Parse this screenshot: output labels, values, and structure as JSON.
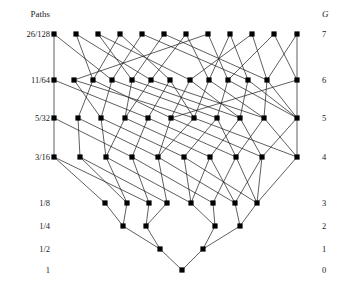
{
  "figure": {
    "header_left": "Paths",
    "header_right": "G",
    "node_color": "#000000",
    "edge_color": "#1a1a1a",
    "background": "#ffffff"
  },
  "chart_data": {
    "type": "diagram",
    "title": "",
    "xlabel": "",
    "ylabel": "",
    "header_left": "Paths",
    "header_right": "G",
    "row_labels_left": [
      "26/128",
      "11/64",
      "5/32",
      "3/16",
      "1/8",
      "1/4",
      "1/2",
      "1"
    ],
    "row_labels_right": [
      "7",
      "6",
      "5",
      "4",
      "3",
      "2",
      "1",
      "0"
    ],
    "row_y": [
      34,
      80,
      118,
      157,
      203,
      226,
      249,
      270
    ],
    "row_counts": [
      12,
      13,
      11,
      10,
      8,
      4,
      2,
      1
    ],
    "nodes": {
      "g7": [
        54,
        76,
        98,
        120,
        142,
        164,
        186,
        208,
        230,
        252,
        274,
        297
      ],
      "g6": [
        54,
        74,
        93,
        112,
        132,
        151,
        170,
        190,
        209,
        228,
        248,
        267,
        297
      ],
      "g5": [
        54,
        78,
        101,
        125,
        148,
        171,
        194,
        217,
        240,
        264,
        297
      ],
      "g4": [
        54,
        80,
        106,
        132,
        158,
        184,
        210,
        236,
        262,
        297
      ],
      "g3": [
        105,
        127,
        149,
        167,
        191,
        213,
        235,
        257
      ],
      "g2": [
        123,
        146,
        215,
        240
      ],
      "g1": [
        160,
        203
      ],
      "g0": [
        182
      ]
    },
    "edges": [
      [
        7,
        0,
        6,
        0
      ],
      [
        7,
        0,
        6,
        3
      ],
      [
        7,
        1,
        6,
        2
      ],
      [
        7,
        1,
        6,
        5
      ],
      [
        7,
        2,
        6,
        4
      ],
      [
        7,
        2,
        6,
        7
      ],
      [
        7,
        3,
        6,
        2
      ],
      [
        7,
        3,
        6,
        6
      ],
      [
        7,
        4,
        6,
        3
      ],
      [
        7,
        4,
        6,
        10
      ],
      [
        7,
        5,
        6,
        4
      ],
      [
        7,
        5,
        6,
        11
      ],
      [
        7,
        6,
        6,
        5
      ],
      [
        7,
        6,
        6,
        8
      ],
      [
        7,
        7,
        6,
        1
      ],
      [
        7,
        7,
        6,
        9
      ],
      [
        7,
        8,
        6,
        8
      ],
      [
        7,
        8,
        6,
        10
      ],
      [
        7,
        9,
        6,
        7
      ],
      [
        7,
        9,
        6,
        11
      ],
      [
        7,
        10,
        6,
        9
      ],
      [
        7,
        10,
        6,
        12
      ],
      [
        7,
        11,
        6,
        11
      ],
      [
        7,
        11,
        6,
        12
      ],
      [
        6,
        0,
        5,
        0
      ],
      [
        6,
        0,
        5,
        4
      ],
      [
        6,
        1,
        5,
        2
      ],
      [
        6,
        1,
        5,
        6
      ],
      [
        6,
        2,
        5,
        1
      ],
      [
        6,
        2,
        5,
        5
      ],
      [
        6,
        3,
        5,
        2
      ],
      [
        6,
        3,
        5,
        7
      ],
      [
        6,
        4,
        5,
        3
      ],
      [
        6,
        4,
        5,
        8
      ],
      [
        6,
        5,
        5,
        3
      ],
      [
        6,
        5,
        5,
        9
      ],
      [
        6,
        6,
        5,
        4
      ],
      [
        6,
        6,
        5,
        6
      ],
      [
        6,
        7,
        5,
        5
      ],
      [
        6,
        7,
        5,
        8
      ],
      [
        6,
        8,
        5,
        6
      ],
      [
        6,
        8,
        5,
        9
      ],
      [
        6,
        9,
        5,
        7
      ],
      [
        6,
        9,
        5,
        10
      ],
      [
        6,
        10,
        5,
        8
      ],
      [
        6,
        10,
        5,
        10
      ],
      [
        6,
        11,
        5,
        9
      ],
      [
        6,
        11,
        5,
        10
      ],
      [
        6,
        12,
        5,
        10
      ],
      [
        6,
        12,
        5,
        5
      ],
      [
        5,
        0,
        4,
        0
      ],
      [
        5,
        0,
        4,
        3
      ],
      [
        5,
        1,
        4,
        1
      ],
      [
        5,
        1,
        4,
        4
      ],
      [
        5,
        2,
        4,
        2
      ],
      [
        5,
        2,
        4,
        5
      ],
      [
        5,
        3,
        4,
        2
      ],
      [
        5,
        3,
        4,
        6
      ],
      [
        5,
        4,
        4,
        3
      ],
      [
        5,
        4,
        4,
        7
      ],
      [
        5,
        5,
        4,
        4
      ],
      [
        5,
        5,
        4,
        8
      ],
      [
        5,
        6,
        4,
        4
      ],
      [
        5,
        6,
        4,
        9
      ],
      [
        5,
        7,
        4,
        5
      ],
      [
        5,
        7,
        4,
        7
      ],
      [
        5,
        8,
        4,
        6
      ],
      [
        5,
        8,
        4,
        8
      ],
      [
        5,
        9,
        4,
        7
      ],
      [
        5,
        9,
        4,
        9
      ],
      [
        5,
        10,
        4,
        9
      ],
      [
        5,
        10,
        4,
        8
      ],
      [
        4,
        0,
        3,
        0
      ],
      [
        4,
        0,
        3,
        2
      ],
      [
        4,
        1,
        3,
        1
      ],
      [
        4,
        1,
        3,
        3
      ],
      [
        4,
        2,
        3,
        1
      ],
      [
        4,
        2,
        3,
        4
      ],
      [
        4,
        3,
        3,
        2
      ],
      [
        4,
        3,
        3,
        5
      ],
      [
        4,
        4,
        3,
        3
      ],
      [
        4,
        4,
        3,
        6
      ],
      [
        4,
        5,
        3,
        4
      ],
      [
        4,
        5,
        3,
        7
      ],
      [
        4,
        6,
        3,
        4
      ],
      [
        4,
        6,
        3,
        6
      ],
      [
        4,
        7,
        3,
        5
      ],
      [
        4,
        7,
        3,
        7
      ],
      [
        4,
        8,
        3,
        6
      ],
      [
        4,
        8,
        3,
        7
      ],
      [
        4,
        9,
        3,
        7
      ],
      [
        3,
        0,
        2,
        0
      ],
      [
        3,
        1,
        2,
        0
      ],
      [
        3,
        2,
        2,
        1
      ],
      [
        3,
        3,
        2,
        1
      ],
      [
        3,
        4,
        2,
        2
      ],
      [
        3,
        5,
        2,
        2
      ],
      [
        3,
        6,
        2,
        3
      ],
      [
        3,
        7,
        2,
        3
      ],
      [
        2,
        0,
        1,
        0
      ],
      [
        2,
        1,
        1,
        0
      ],
      [
        2,
        2,
        1,
        1
      ],
      [
        2,
        3,
        1,
        1
      ],
      [
        1,
        0,
        0,
        0
      ],
      [
        1,
        1,
        0,
        0
      ]
    ]
  }
}
